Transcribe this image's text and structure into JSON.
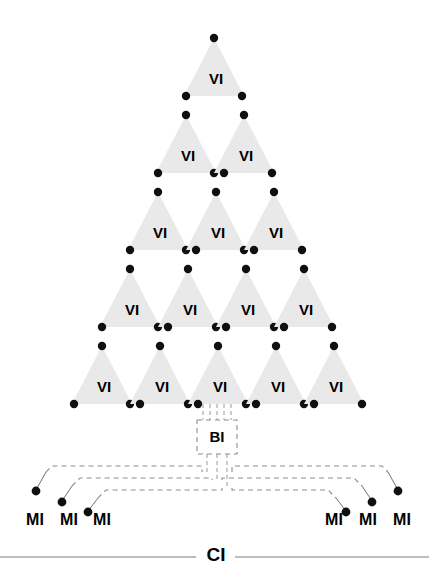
{
  "diagram": {
    "title": "",
    "colors": {
      "triangle_fill": "#e9e9e9",
      "dot": "#101010",
      "dashed_line": "#8c8c8c",
      "solid_line": "#6f6f6f",
      "baseline": "#7a7a7a",
      "text": "#000000",
      "background": "#ffffff"
    },
    "pyramid": {
      "label": "VI",
      "rows": [
        {
          "row": 1,
          "count": 1,
          "labels": [
            "VI"
          ]
        },
        {
          "row": 2,
          "count": 2,
          "labels": [
            "VI",
            "VI"
          ]
        },
        {
          "row": 3,
          "count": 3,
          "labels": [
            "VI",
            "VI",
            "VI"
          ]
        },
        {
          "row": 4,
          "count": 4,
          "labels": [
            "VI",
            "VI",
            "VI",
            "VI"
          ]
        },
        {
          "row": 5,
          "count": 5,
          "labels": [
            "VI",
            "VI",
            "VI",
            "VI",
            "VI"
          ]
        }
      ],
      "total_triangles": 15,
      "dots_per_triangle": 3
    },
    "bi": {
      "label": "BI"
    },
    "mi": {
      "label": "MI",
      "left_labels": [
        "MI",
        "MI",
        "MI"
      ],
      "right_labels": [
        "MI",
        "MI",
        "MI"
      ],
      "count": 6
    },
    "ci": {
      "label": "CI"
    }
  }
}
